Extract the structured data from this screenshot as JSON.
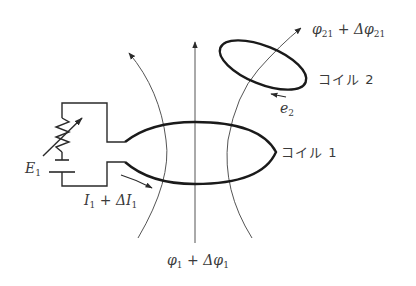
{
  "diagram": {
    "labels": {
      "coil1": "コイル 1",
      "coil2": "コイル 2",
      "emf_source": {
        "base": "E",
        "sub": "1"
      },
      "current": {
        "base1": "I",
        "sub1": "1",
        "op": " + ",
        "delta": "Δ",
        "base2": "I",
        "sub2": "1"
      },
      "flux1": {
        "base1": "φ",
        "sub1": "1",
        "op": " + ",
        "delta": "Δ",
        "base2": "φ",
        "sub2": "1"
      },
      "flux21": {
        "base1": "φ",
        "sub1": "21",
        "op": " + ",
        "delta": "Δ",
        "base2": "φ",
        "sub2": "21"
      },
      "induced_emf": {
        "base": "e",
        "sub": "2"
      }
    },
    "components": [
      "variable-resistor",
      "battery E1",
      "coil 1 (primary loop)",
      "coil 2 (secondary loop)",
      "magnetic field lines"
    ],
    "colors": {
      "line": "#2a2a2a",
      "coil": "#1a1a1a",
      "field": "#555555",
      "text": "#3a3a3a"
    }
  }
}
